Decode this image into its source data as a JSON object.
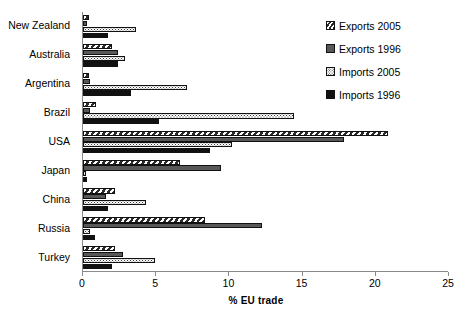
{
  "chart_data": {
    "type": "bar",
    "orientation": "horizontal",
    "title": "",
    "xlabel": "% EU trade",
    "ylabel": "",
    "xlim": [
      0,
      25
    ],
    "xticks": [
      0,
      5,
      10,
      15,
      20,
      25
    ],
    "grid": false,
    "legend_position": "top-right",
    "categories": [
      "New Zealand",
      "Australia",
      "Argentina",
      "Brazil",
      "USA",
      "Japan",
      "China",
      "Russia",
      "Turkey"
    ],
    "series": [
      {
        "name": "Exports 2005",
        "style": "hatched",
        "values": [
          0.4,
          2.0,
          0.4,
          0.9,
          20.8,
          6.6,
          2.2,
          8.3,
          2.2
        ]
      },
      {
        "name": "Exports 1996",
        "style": "dark-gray",
        "values": [
          0.3,
          2.4,
          0.5,
          0.5,
          17.8,
          9.4,
          1.6,
          12.2,
          2.7
        ]
      },
      {
        "name": "Imports 2005",
        "style": "white-dotted",
        "values": [
          3.6,
          2.9,
          7.1,
          14.4,
          10.2,
          0.2,
          4.3,
          0.5,
          4.9
        ]
      },
      {
        "name": "Imports 1996",
        "style": "black",
        "values": [
          1.7,
          2.4,
          3.3,
          5.2,
          8.7,
          0.3,
          1.7,
          0.8,
          2.0
        ]
      }
    ]
  },
  "legend": {
    "items": [
      {
        "label": "Exports 2005",
        "style": "e05"
      },
      {
        "label": "Exports 1996",
        "style": "e96"
      },
      {
        "label": "Imports 2005",
        "style": "i05"
      },
      {
        "label": "Imports 1996",
        "style": "i96"
      }
    ]
  },
  "axis": {
    "x_title": "% EU trade"
  }
}
